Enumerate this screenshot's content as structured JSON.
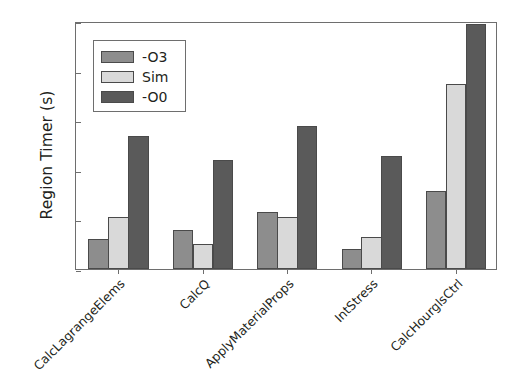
{
  "chart_data": {
    "type": "bar",
    "title": "",
    "xlabel": "",
    "ylabel": "Region Timer (s)",
    "categories": [
      "CalcLagrangeElems",
      "CalcQ",
      "ApplyMaterialProps",
      "IntStress",
      "CalcHourglsCtrl"
    ],
    "series": [
      {
        "name": "-O3",
        "color": "#8d8d8d",
        "values": [
          3.0,
          3.9,
          5.7,
          2.0,
          7.9
        ]
      },
      {
        "name": "Sim",
        "color": "#d9d9d9",
        "values": [
          5.2,
          2.5,
          5.2,
          3.2,
          18.7
        ]
      },
      {
        "name": "-O0",
        "color": "#5a5a5a",
        "values": [
          13.4,
          11.0,
          14.4,
          11.4,
          24.7
        ]
      }
    ],
    "ylim": [
      0,
      25
    ],
    "yticks": [
      0,
      5,
      10,
      15,
      20,
      25
    ],
    "ytick_labels": [
      "0",
      "5",
      "10",
      "15",
      "20",
      "25"
    ],
    "grid": false,
    "legend_position": "upper left",
    "xtick_rotation": -45,
    "axis_color": "#6e6e6e",
    "text_color": "#231f20",
    "background": "#ffffff"
  }
}
